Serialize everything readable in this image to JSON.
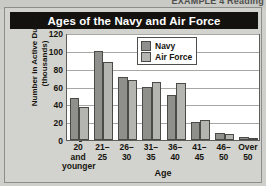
{
  "page_header": {
    "partial_text": "EXAMPLE 4 Reading"
  },
  "card": {
    "title": "Ages of the Navy and Air Force"
  },
  "legend": {
    "position": "top-right",
    "entries": [
      {
        "label": "Navy",
        "color": "#8f8f8b"
      },
      {
        "label": "Air Force",
        "color": "#b4b4b0"
      }
    ]
  },
  "axes": {
    "y_title": "Number in Active Duty (thousands)",
    "x_title": "Age",
    "y_ticks": [
      0,
      20,
      40,
      60,
      80,
      100,
      120
    ]
  },
  "chart_data": {
    "type": "bar",
    "title": "Ages of the Navy and Air Force",
    "xlabel": "Age",
    "ylabel": "Number in Active Duty (thousands)",
    "ylim": [
      0,
      120
    ],
    "ytick_step": 20,
    "grid": true,
    "legend_position": "top-right",
    "categories": [
      "20 and younger",
      "21-25",
      "26-30",
      "31-35",
      "36-40",
      "41-45",
      "46-50",
      "Over 50"
    ],
    "category_lines": [
      [
        "20",
        "and",
        "younger"
      ],
      [
        "21–",
        "25"
      ],
      [
        "26–",
        "30"
      ],
      [
        "31–",
        "35"
      ],
      [
        "36–",
        "40"
      ],
      [
        "41–",
        "45"
      ],
      [
        "46–",
        "50"
      ],
      [
        "Over",
        "50"
      ]
    ],
    "series": [
      {
        "name": "Navy",
        "color": "#8f8f8b",
        "values": [
          47,
          100,
          71,
          59,
          51,
          20,
          8,
          3
        ]
      },
      {
        "name": "Air Force",
        "color": "#b4b4b0",
        "values": [
          37,
          88,
          67,
          65,
          64,
          23,
          7,
          2
        ]
      }
    ]
  }
}
